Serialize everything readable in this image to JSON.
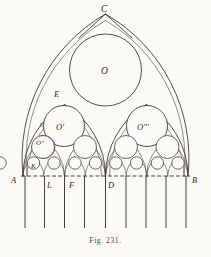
{
  "figure": {
    "caption": "Fig. 231.",
    "background_color": "#fbfaf6",
    "ink_color": "#35302c"
  },
  "labels": {
    "apex": "C",
    "left_base": "A",
    "right_base": "B",
    "center_base": "D",
    "inner_left_1": "L",
    "inner_left_2": "F",
    "springing_left": "K",
    "arch_point_left": "E",
    "small_mark": "S",
    "circle_main": "O",
    "circle_left": "O'",
    "circle_small_left": "O''",
    "circle_right": "O'''"
  },
  "geometry": {
    "baseline_y": 176,
    "left_x": 23,
    "right_x": 188,
    "center_x": 105.5,
    "apex_y": 14,
    "main_circle": {
      "cx": 105.5,
      "cy": 70,
      "r": 36
    },
    "side_circles": [
      {
        "name": "O'",
        "cx": 64,
        "cy": 126,
        "r": 20
      },
      {
        "name": "O'''",
        "cx": 147,
        "cy": 126,
        "r": 20
      }
    ],
    "row_circles": [
      {
        "cx": 43,
        "cy": 146,
        "r": 11
      },
      {
        "cx": 84,
        "cy": 146,
        "r": 11
      },
      {
        "cx": 127,
        "cy": 146,
        "r": 11
      },
      {
        "cx": 168,
        "cy": 146,
        "r": 11
      }
    ],
    "mullion_x": [
      25,
      45,
      64.5,
      84.5,
      105.5,
      126,
      146,
      166,
      186
    ],
    "mullion_top": 176,
    "mullion_bottom": 228,
    "label_positions": {
      "C": {
        "x": 103,
        "y": 11
      },
      "O": {
        "x": 102,
        "y": 74
      },
      "E": {
        "x": 57,
        "y": 95
      },
      "O'": {
        "x": 58,
        "y": 129
      },
      "O'''": {
        "x": 139,
        "y": 129
      },
      "O''": {
        "x": 36,
        "y": 143
      },
      "S": {
        "x": 41,
        "y": 126
      },
      "K": {
        "x": 32,
        "y": 166
      },
      "A": {
        "x": 13,
        "y": 182
      },
      "B": {
        "x": 193,
        "y": 182
      },
      "L": {
        "x": 45,
        "y": 186
      },
      "F": {
        "x": 68,
        "y": 186
      },
      "D": {
        "x": 108,
        "y": 186
      }
    }
  }
}
